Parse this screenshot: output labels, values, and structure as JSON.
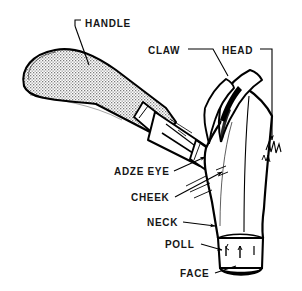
{
  "figure": {
    "style": "black-and-white line drawing with stippled handle",
    "background_color": "#ffffff",
    "line_color": "#000000",
    "label_color": "#161616",
    "handle_fill": "stipple-dot-pattern",
    "labels": [
      {
        "id": "handle",
        "text": "HANDLE",
        "x": 85,
        "y": 18
      },
      {
        "id": "claw",
        "text": "CLAW",
        "x": 148,
        "y": 45
      },
      {
        "id": "head",
        "text": "HEAD",
        "x": 222,
        "y": 45
      },
      {
        "id": "adze-eye",
        "text": "ADZE EYE",
        "x": 114,
        "y": 166
      },
      {
        "id": "cheek",
        "text": "CHEEK",
        "x": 131,
        "y": 192
      },
      {
        "id": "neck",
        "text": "NECK",
        "x": 147,
        "y": 217
      },
      {
        "id": "poll",
        "text": "POLL",
        "x": 165,
        "y": 239
      },
      {
        "id": "face",
        "text": "FACE",
        "x": 180,
        "y": 268
      }
    ]
  }
}
